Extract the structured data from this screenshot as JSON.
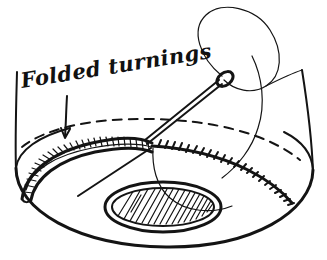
{
  "figure": {
    "kind": "hand-drawn line illustration",
    "background_color": "#ffffff",
    "ink_color": "#141414"
  },
  "annotations": {
    "folded_turnings_label": "Folded turnings",
    "leader_arrow": "arrow-down-to-band"
  },
  "parts": {
    "fabric_body": "circular-fabric-base",
    "fold_line": "dashed-fold-line",
    "turnings_band": "cross-hatched-folded-band",
    "stitch_row": "whip-stitch-row",
    "needle": "sewing-needle",
    "needle_eye": "needle-eye",
    "thread_loop": "thread-loop",
    "thread_tail": "thread-tail",
    "center_oval": "hatched-center-oval",
    "left_edge": "left-fabric-edge",
    "right_edge": "right-fabric-edge"
  },
  "counts": {
    "stitch_marks": 22,
    "band_cells": 26,
    "center_hatch_lines": 17
  }
}
